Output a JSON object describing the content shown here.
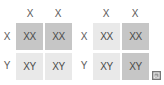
{
  "left_square": {
    "col_headers": [
      "X",
      "X"
    ],
    "row_headers": [
      "X",
      "Y"
    ],
    "cells": [
      [
        "XX",
        "XX"
      ],
      [
        "XY",
        "XY"
      ]
    ],
    "shading": [
      [
        "dark",
        "dark"
      ],
      [
        "light",
        "light"
      ]
    ]
  },
  "right_square": {
    "col_headers": [
      "X",
      "X"
    ],
    "row_headers": [
      "X",
      "Y"
    ],
    "cells": [
      [
        "XX",
        "XX"
      ],
      [
        "XY",
        "XY"
      ]
    ],
    "shading": [
      [
        "light",
        "dark"
      ],
      [
        "light",
        "dark"
      ]
    ]
  },
  "corner_badge": "",
  "colors": {
    "dark": "#c6c6c6",
    "light": "#e9e9e9",
    "text": "#4a4a4a"
  }
}
